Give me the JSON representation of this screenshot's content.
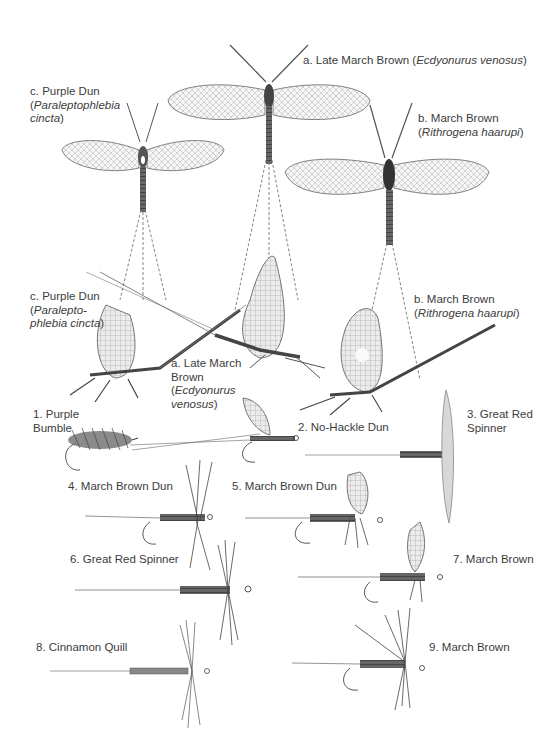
{
  "plate": {
    "naturals_top": [
      {
        "id": "a",
        "prefix": "a. ",
        "common": "Late March Brown",
        "latin": "Ecdyonurus venosus",
        "view": "spinner-dorsal"
      },
      {
        "id": "b",
        "prefix": "b. ",
        "common": "March Brown",
        "latin": "Rithrogena haarupi",
        "view": "spinner-dorsal"
      },
      {
        "id": "c",
        "prefix": "c. ",
        "common": "Purple Dun",
        "latin_line1": "Paraleptophlebia",
        "latin_line2": "cincta",
        "view": "spinner-dorsal"
      }
    ],
    "naturals_side": [
      {
        "id": "c",
        "prefix": "c. ",
        "common": "Purple Dun",
        "latin_line1": "Paralepto-",
        "latin_line2": "phlebia cincta",
        "view": "dun-side"
      },
      {
        "id": "a",
        "prefix": "a. ",
        "common_line1": "Late March",
        "common_line2": "Brown",
        "latin_line1": "Ecdyonurus",
        "latin_line2": "venosus",
        "view": "dun-side"
      },
      {
        "id": "b",
        "prefix": "b. ",
        "common": "March Brown",
        "latin": "Rithrogena haarupi",
        "view": "dun-side"
      }
    ],
    "artificial_flies": [
      {
        "num": "1.",
        "line1": "Purple",
        "line2": "Bumble"
      },
      {
        "num": "2.",
        "name": "No-Hackle Dun"
      },
      {
        "num": "3.",
        "line1": "Great Red",
        "line2": "Spinner"
      },
      {
        "num": "4.",
        "name": "March Brown Dun"
      },
      {
        "num": "5.",
        "name": "March Brown Dun"
      },
      {
        "num": "6.",
        "name": "Great Red Spinner"
      },
      {
        "num": "7.",
        "name": "March Brown"
      },
      {
        "num": "8.",
        "name": "Cinnamon Quill"
      },
      {
        "num": "9.",
        "name": "March Brown"
      }
    ],
    "colors": {
      "ink": "#3c3c3c",
      "paper": "#ffffff",
      "wing": "#f4f4f4",
      "body": "#555555"
    }
  }
}
